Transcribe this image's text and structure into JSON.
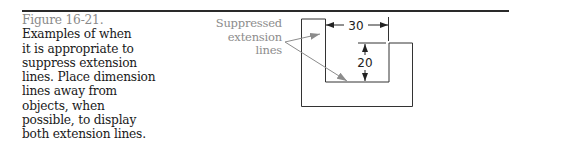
{
  "figure": {
    "number": "Figure 16-21.",
    "caption": "Examples of when\nit is appropriate to\nsuppress extension\nlines. Place dimension\nlines away from\nobjects, when\npossible, to display\nboth extension lines."
  },
  "drawing": {
    "callout_label": "Suppressed\nextension\nlines",
    "dimensions": {
      "horizontal": "30",
      "vertical": "20"
    },
    "colors": {
      "outline": "#333333",
      "leader": "#8c8c8c",
      "rule": "#2a2a2a"
    }
  }
}
